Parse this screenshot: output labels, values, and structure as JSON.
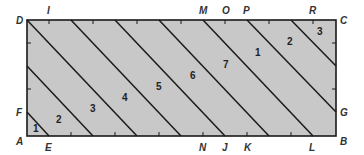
{
  "diagram": {
    "type": "rectangle-with-parallel-diagonal-strips",
    "colors": {
      "fill": "#c8c8c8",
      "stroke": "#1a1a1a",
      "text": "#333333"
    },
    "rect": {
      "x": 27,
      "y": 20,
      "width": 309,
      "height": 116
    },
    "corners": [
      {
        "label": "D",
        "x": 16,
        "y": 24
      },
      {
        "label": "C",
        "x": 340,
        "y": 24
      },
      {
        "label": "A",
        "x": 16,
        "y": 145
      },
      {
        "label": "B",
        "x": 340,
        "y": 145
      }
    ],
    "point_labels": [
      {
        "label": "I",
        "x": 47,
        "y": 14
      },
      {
        "label": "M",
        "x": 199,
        "y": 14
      },
      {
        "label": "O",
        "x": 222,
        "y": 14
      },
      {
        "label": "P",
        "x": 243,
        "y": 14
      },
      {
        "label": "R",
        "x": 309,
        "y": 14
      },
      {
        "label": "F",
        "x": 16,
        "y": 116
      },
      {
        "label": "G",
        "x": 340,
        "y": 116
      },
      {
        "label": "E",
        "x": 45,
        "y": 151
      },
      {
        "label": "N",
        "x": 199,
        "y": 151
      },
      {
        "label": "J",
        "x": 222,
        "y": 151
      },
      {
        "label": "K",
        "x": 244,
        "y": 151
      },
      {
        "label": "L",
        "x": 309,
        "y": 151
      }
    ],
    "region_labels": [
      {
        "label": "1",
        "x": 33,
        "y": 132
      },
      {
        "label": "2",
        "x": 56,
        "y": 123
      },
      {
        "label": "3",
        "x": 90,
        "y": 112
      },
      {
        "label": "4",
        "x": 122,
        "y": 101
      },
      {
        "label": "5",
        "x": 156,
        "y": 90
      },
      {
        "label": "6",
        "x": 190,
        "y": 79
      },
      {
        "label": "7",
        "x": 223,
        "y": 68
      },
      {
        "label": "1",
        "x": 255,
        "y": 56
      },
      {
        "label": "2",
        "x": 287,
        "y": 45
      },
      {
        "label": "3",
        "x": 317,
        "y": 35
      }
    ],
    "diagonals": [
      {
        "from": "F",
        "to": "E",
        "x1": 27,
        "y1": 112,
        "x2": 49,
        "y2": 136
      },
      {
        "x1": 27,
        "y1": 66,
        "x2": 93,
        "y2": 136
      },
      {
        "from": "D",
        "x1": 27,
        "y1": 20,
        "x2": 137,
        "y2": 136
      },
      {
        "x1": 71,
        "y1": 20,
        "x2": 181,
        "y2": 136
      },
      {
        "x1": 115,
        "y1": 20,
        "x2": 225,
        "y2": 136
      },
      {
        "x1": 159,
        "y1": 20,
        "x2": 269,
        "y2": 136
      },
      {
        "from": "M",
        "to": "L",
        "x1": 203,
        "y1": 20,
        "x2": 313,
        "y2": 136
      },
      {
        "from": "P",
        "to": "G",
        "x1": 247,
        "y1": 20,
        "x2": 336,
        "y2": 112
      },
      {
        "x1": 291,
        "y1": 20,
        "x2": 336,
        "y2": 66
      }
    ],
    "ticks_top": [
      49,
      93,
      137,
      181,
      225,
      269,
      313
    ],
    "ticks_bottom": [
      71,
      115,
      159,
      203,
      247,
      291
    ],
    "ticks_left": [
      43,
      89
    ],
    "ticks_right": [
      43,
      89
    ]
  }
}
